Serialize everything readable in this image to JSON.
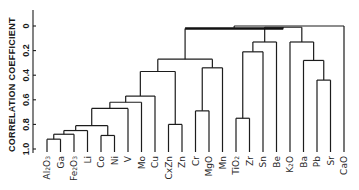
{
  "chart_data": {
    "type": "dendrogram",
    "title": "",
    "ylabel": "CORRELATION COEFFICIENT",
    "y_axis": {
      "ticks": [
        0,
        0.2,
        0.4,
        0.6,
        0.8,
        1.0
      ],
      "tick_labels": [
        "0",
        "0.2",
        "0.4",
        "0.6",
        "0.8",
        "1.0"
      ],
      "range": [
        0,
        1.0
      ],
      "inverted": true
    },
    "grid": false,
    "legend": null,
    "leaves": [
      {
        "id": "Al2O3",
        "label": "Al",
        "sub": "2",
        "label2": "O",
        "sub2": "3"
      },
      {
        "id": "Ga",
        "label": "Ga"
      },
      {
        "id": "Fe2O3",
        "label": "Fe",
        "sub": "2",
        "label2": "O",
        "sub2": "3"
      },
      {
        "id": "Li",
        "label": "Li"
      },
      {
        "id": "Co",
        "label": "Co"
      },
      {
        "id": "Ni",
        "label": "Ni"
      },
      {
        "id": "V",
        "label": "V"
      },
      {
        "id": "Mo",
        "label": "Mo"
      },
      {
        "id": "Cu",
        "label": "Cu"
      },
      {
        "id": "CxZn",
        "label": "CxZn"
      },
      {
        "id": "Zn",
        "label": "Zn"
      },
      {
        "id": "Cr",
        "label": "Cr"
      },
      {
        "id": "MgO",
        "label": "MgO"
      },
      {
        "id": "Mn",
        "label": "Mn"
      },
      {
        "id": "TiO2",
        "label": "TiO",
        "sub": "2"
      },
      {
        "id": "Zr",
        "label": "Zr"
      },
      {
        "id": "Sn",
        "label": "Sn"
      },
      {
        "id": "Be",
        "label": "Be"
      },
      {
        "id": "K2O",
        "label": "K",
        "sub": "2",
        "label2": "O"
      },
      {
        "id": "Ba",
        "label": "Ba"
      },
      {
        "id": "Pb",
        "label": "Pb"
      },
      {
        "id": "Sr",
        "label": "Sr"
      },
      {
        "id": "CaO",
        "label": "CaO"
      }
    ],
    "merges": [
      {
        "id": "n1",
        "children": [
          "Al2O3",
          "Ga"
        ],
        "height": 0.92
      },
      {
        "id": "n2",
        "children": [
          "n1",
          "Fe2O3"
        ],
        "height": 0.88
      },
      {
        "id": "n3",
        "children": [
          "n2",
          "Li"
        ],
        "height": 0.85
      },
      {
        "id": "n4",
        "children": [
          "Co",
          "Ni"
        ],
        "height": 0.89
      },
      {
        "id": "n5",
        "children": [
          "n3",
          "n4"
        ],
        "height": 0.81
      },
      {
        "id": "n6",
        "children": [
          "n5",
          "V"
        ],
        "height": 0.67
      },
      {
        "id": "n7",
        "children": [
          "n6",
          "Mo"
        ],
        "height": 0.62
      },
      {
        "id": "n8",
        "children": [
          "n7",
          "Cu"
        ],
        "height": 0.57
      },
      {
        "id": "n9",
        "children": [
          "CxZn",
          "Zn"
        ],
        "height": 0.8
      },
      {
        "id": "n10",
        "children": [
          "n8",
          "n9"
        ],
        "height": 0.37
      },
      {
        "id": "n11",
        "children": [
          "Cr",
          "MgO"
        ],
        "height": 0.69
      },
      {
        "id": "n12",
        "children": [
          "n11",
          "Mn"
        ],
        "height": 0.34
      },
      {
        "id": "n13",
        "children": [
          "n10",
          "n12"
        ],
        "height": 0.27
      },
      {
        "id": "n14",
        "children": [
          "TiO2",
          "Zr"
        ],
        "height": 0.75
      },
      {
        "id": "n15",
        "children": [
          "n14",
          "Sn"
        ],
        "height": 0.21
      },
      {
        "id": "n16",
        "children": [
          "n15",
          "Be"
        ],
        "height": 0.13
      },
      {
        "id": "n17",
        "children": [
          "Pb",
          "Sr"
        ],
        "height": 0.44
      },
      {
        "id": "n18",
        "children": [
          "Ba",
          "n17"
        ],
        "height": 0.28
      },
      {
        "id": "n19",
        "children": [
          "K2O",
          "n18"
        ],
        "height": 0.13
      },
      {
        "id": "n20",
        "children": [
          "n16",
          "n19"
        ],
        "height": 0.01
      },
      {
        "id": "n21",
        "children": [
          "n13",
          "n20"
        ],
        "height": 0.02,
        "thick": true
      },
      {
        "id": "n22",
        "children": [
          "n21",
          "CaO"
        ],
        "height": 0.0
      }
    ]
  }
}
